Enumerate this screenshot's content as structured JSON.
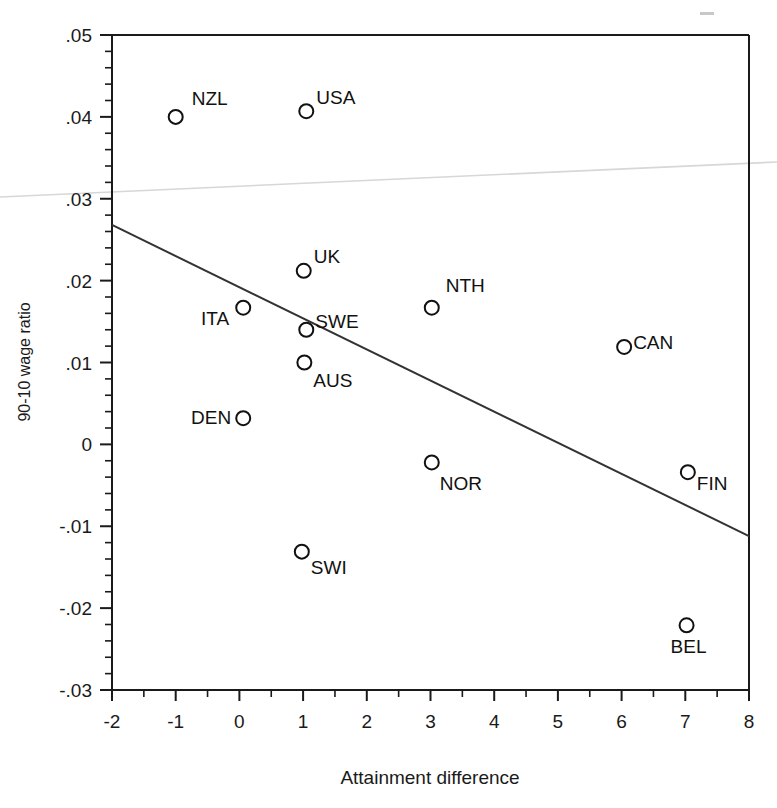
{
  "chart_data": {
    "type": "scatter",
    "title": "",
    "xlabel": "Attainment difference",
    "ylabel": "90-10 wage ratio",
    "xlim": [
      -2,
      8
    ],
    "ylim": [
      -0.03,
      0.05
    ],
    "grid": false,
    "legend": "none",
    "x_ticks": [
      "-2",
      "-1",
      "0",
      "1",
      "2",
      "3",
      "4",
      "5",
      "6",
      "7",
      "8"
    ],
    "x_tick_values": [
      -2,
      -1,
      0,
      1,
      2,
      3,
      4,
      5,
      6,
      7,
      8
    ],
    "x_minor_ticks_per_interval": 1,
    "y_ticks": [
      ".05",
      ".04",
      ".03",
      ".02",
      ".01",
      "0",
      "-.01",
      "-.02",
      "-.03"
    ],
    "y_tick_values": [
      0.05,
      0.04,
      0.03,
      0.02,
      0.01,
      0,
      -0.01,
      -0.02,
      -0.03
    ],
    "y_minor_ticks_per_interval": 4,
    "marker": "open-circle",
    "points": [
      {
        "label": "NZL",
        "x": -1.0,
        "y": 0.04,
        "label_dx": 16,
        "label_dy": -12,
        "anchor": "start"
      },
      {
        "label": "USA",
        "x": 1.05,
        "y": 0.0407,
        "label_dx": 10,
        "label_dy": -7,
        "anchor": "start"
      },
      {
        "label": "UK",
        "x": 1.01,
        "y": 0.0212,
        "label_dx": 10,
        "label_dy": -8,
        "anchor": "start"
      },
      {
        "label": "ITA",
        "x": 0.06,
        "y": 0.0167,
        "label_dx": -14,
        "label_dy": 17,
        "anchor": "end"
      },
      {
        "label": "SWE",
        "x": 1.05,
        "y": 0.014,
        "label_dx": 9,
        "label_dy": -2,
        "anchor": "start"
      },
      {
        "label": "AUS",
        "x": 1.02,
        "y": 0.01,
        "label_dx": 9,
        "label_dy": 24,
        "anchor": "start"
      },
      {
        "label": "DEN",
        "x": 0.06,
        "y": 0.0032,
        "label_dx": -12,
        "label_dy": 6,
        "anchor": "end"
      },
      {
        "label": "NTH",
        "x": 3.02,
        "y": 0.0167,
        "label_dx": 14,
        "label_dy": -16,
        "anchor": "start"
      },
      {
        "label": "CAN",
        "x": 6.04,
        "y": 0.0119,
        "label_dx": 9,
        "label_dy": 2,
        "anchor": "start"
      },
      {
        "label": "NOR",
        "x": 3.02,
        "y": -0.0022,
        "label_dx": 8,
        "label_dy": 28,
        "anchor": "start"
      },
      {
        "label": "FIN",
        "x": 7.04,
        "y": -0.0034,
        "label_dx": 9,
        "label_dy": 18,
        "anchor": "start"
      },
      {
        "label": "SWI",
        "x": 0.98,
        "y": -0.0131,
        "label_dx": 9,
        "label_dy": 22,
        "anchor": "start"
      },
      {
        "label": "BEL",
        "x": 7.02,
        "y": -0.0221,
        "label_dx": 2,
        "label_dy": 28,
        "anchor": "middle"
      }
    ],
    "fit_line": {
      "name": "regression-line",
      "x0": -2,
      "y0": 0.0268,
      "x1": 8,
      "y1": -0.0112
    },
    "artifacts": [
      {
        "name": "scan-streak",
        "x0": 0,
        "y0": 197,
        "x1": 777,
        "y1": 162,
        "color": "#d7d7d7"
      },
      {
        "name": "scan-speck",
        "x": 700,
        "y": 12,
        "w": 14,
        "h": 3,
        "color": "#c8c8c8"
      }
    ],
    "colors": {
      "axis": "#1a1a1a",
      "marker_stroke": "#111111",
      "fit_line": "#333333",
      "background": "#ffffff"
    }
  }
}
